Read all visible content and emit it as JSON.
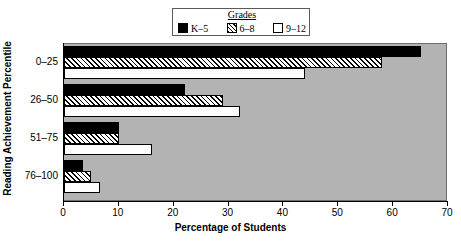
{
  "chart_data": {
    "type": "bar",
    "orientation": "horizontal",
    "title": "",
    "xlabel": "Percentage of Students",
    "ylabel": "Reading Achievement Percentile",
    "categories": [
      "0–25",
      "26–50",
      "51–75",
      "76–100"
    ],
    "series": [
      {
        "name": "K–5",
        "pattern": "solid",
        "color": "#000000",
        "values": [
          65,
          22,
          10,
          3.5
        ]
      },
      {
        "name": "6–8",
        "pattern": "hatch",
        "color": "#000000",
        "values": [
          58,
          29,
          10,
          5
        ]
      },
      {
        "name": "9–12",
        "pattern": "white",
        "color": "#ffffff",
        "values": [
          44,
          32,
          16,
          6.5
        ]
      }
    ],
    "xlim": [
      0,
      70
    ],
    "xticks": [
      0,
      10,
      20,
      30,
      40,
      50,
      60,
      70
    ],
    "grid": false,
    "legend_position": "top-center",
    "plot_background": "#b3b3b3"
  },
  "legend": {
    "title": "Grades",
    "entries": [
      {
        "label": "K–5",
        "swatch": "solid"
      },
      {
        "label": "6–8",
        "swatch": "hatch"
      },
      {
        "label": "9–12",
        "swatch": "white"
      }
    ]
  },
  "axes": {
    "x": {
      "label": "Percentage of Students",
      "ticks": [
        "0",
        "10",
        "20",
        "30",
        "40",
        "50",
        "60",
        "70"
      ]
    },
    "y": {
      "label": "Reading Achievement Percentile",
      "ticks": [
        "0–25",
        "26–50",
        "51–75",
        "76–100"
      ]
    }
  }
}
